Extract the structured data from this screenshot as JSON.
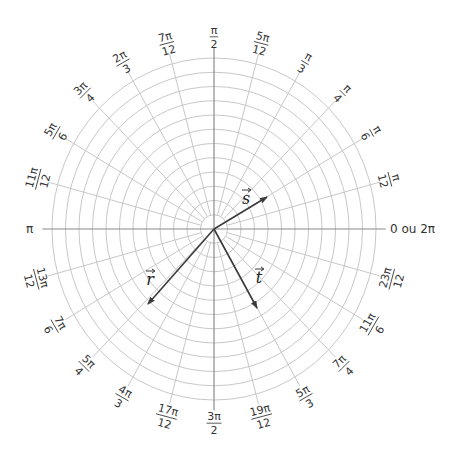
{
  "diagram": {
    "type": "polar-grid",
    "center": [
      214,
      229
    ],
    "radius_x": 162,
    "radius_y": 171,
    "circle_count": 12,
    "radial_step_deg": 15,
    "colors": {
      "grid": "#c8c8c8",
      "axes": "#8a8a8a",
      "vectors": "#3a3a3a",
      "text": "#333333"
    },
    "axis_labels": {
      "zero": "0 ou 2π",
      "pi": "π"
    },
    "angle_labels": [
      {
        "deg": 15,
        "num": "π",
        "den": "12"
      },
      {
        "deg": 30,
        "num": "π",
        "den": "6"
      },
      {
        "deg": 45,
        "num": "π",
        "den": "4"
      },
      {
        "deg": 60,
        "num": "π",
        "den": "3"
      },
      {
        "deg": 75,
        "num": "5π",
        "den": "12"
      },
      {
        "deg": 90,
        "num": "π",
        "den": "2"
      },
      {
        "deg": 105,
        "num": "7π",
        "den": "12"
      },
      {
        "deg": 120,
        "num": "2π",
        "den": "3"
      },
      {
        "deg": 135,
        "num": "3π",
        "den": "4"
      },
      {
        "deg": 150,
        "num": "5π",
        "den": "6"
      },
      {
        "deg": 165,
        "num": "11π",
        "den": "12"
      },
      {
        "deg": 195,
        "num": "13π",
        "den": "12"
      },
      {
        "deg": 210,
        "num": "7π",
        "den": "6"
      },
      {
        "deg": 225,
        "num": "5π",
        "den": "4"
      },
      {
        "deg": 240,
        "num": "4π",
        "den": "3"
      },
      {
        "deg": 255,
        "num": "17π",
        "den": "12"
      },
      {
        "deg": 270,
        "num": "3π",
        "den": "2"
      },
      {
        "deg": 285,
        "num": "19π",
        "den": "12"
      },
      {
        "deg": 300,
        "num": "5π",
        "den": "3"
      },
      {
        "deg": 315,
        "num": "7π",
        "den": "4"
      },
      {
        "deg": 330,
        "num": "11π",
        "den": "6"
      },
      {
        "deg": 345,
        "num": "23π",
        "den": "12"
      }
    ],
    "vectors": [
      {
        "name": "s",
        "label": "s",
        "tip": [
          267,
          197
        ],
        "label_pos": [
          246,
          204
        ]
      },
      {
        "name": "r",
        "label": "r",
        "tip": [
          148,
          304
        ],
        "label_pos": [
          150,
          285
        ]
      },
      {
        "name": "t",
        "label": "t",
        "tip": [
          257,
          308
        ],
        "label_pos": [
          259,
          283
        ]
      }
    ]
  }
}
